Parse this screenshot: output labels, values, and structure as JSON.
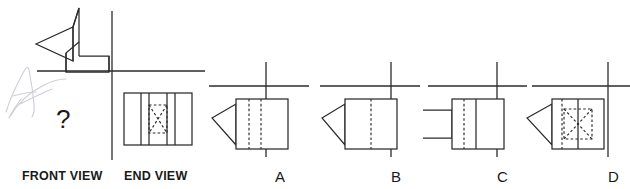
{
  "page": {
    "width": 630,
    "height": 189,
    "background": "#ffffff",
    "line_color": "#2b2b2b",
    "annotation_color": "#c9c9d6"
  },
  "given": {
    "front_view": {
      "label": "FRONT VIEW",
      "placeholder": "?",
      "description": "missing front view, marked with question mark"
    },
    "end_view": {
      "label": "END VIEW",
      "description": "rectangle divided by four vertical solid lines with hidden dashed rectangle and dashed diagonal cross in the central panel"
    },
    "pictorial": {
      "description": "L-shaped block with a wedge/arrow prism projecting to the left"
    },
    "handwriting_annotation": "A"
  },
  "options": [
    {
      "id": "A",
      "label": "A",
      "left_profile": "triangle-wedge",
      "rect_features": "two hidden dashed vertical lines"
    },
    {
      "id": "B",
      "label": "B",
      "left_profile": "triangle-wedge",
      "rect_features": "one hidden dashed vertical centre line"
    },
    {
      "id": "C",
      "label": "C",
      "left_profile": "rectangular-block",
      "rect_features": "one hidden dashed vertical line and one solid vertical line"
    },
    {
      "id": "D",
      "label": "D",
      "left_profile": "triangle-wedge",
      "rect_features": "hidden dashed vertical line, solid vertical line, hidden dashed rectangle with diagonal cross"
    }
  ],
  "labels": {
    "front_view": "FRONT VIEW",
    "end_view": "END VIEW",
    "question_mark": "?",
    "option_a": "A",
    "option_b": "B",
    "option_c": "C",
    "option_d": "D"
  }
}
